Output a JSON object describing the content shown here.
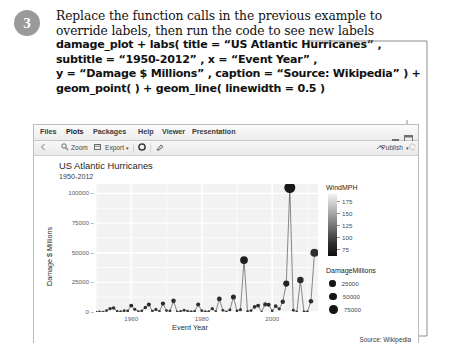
{
  "instruction": {
    "step_number": "3",
    "prose_lines": [
      "Replace the function calls in the previous example to",
      "override labels, then run the code to see new labels"
    ],
    "code_lines": [
      "damage_plot + labs( title = “US Atlantic Hurricanes” ,",
      "subtitle = “1950-2012” , x = “Event Year” ,",
      "y = “Damage $ Millions” , caption = “Source: Wikipedia” ) +",
      "geom_point( ) + geom_line( linewidth = 0.5 )"
    ]
  },
  "rstudio": {
    "tabs": [
      {
        "label": "Files",
        "active": false
      },
      {
        "label": "Plots",
        "active": true
      },
      {
        "label": "Packages",
        "active": false
      },
      {
        "label": "Help",
        "active": false
      },
      {
        "label": "Viewer",
        "active": false
      },
      {
        "label": "Presentation",
        "active": false
      }
    ],
    "window_controls": [
      "minimize-icon",
      "maximize-icon"
    ],
    "toolbar": {
      "back_icon": "back-arrow-icon",
      "zoom_label": "Zoom",
      "zoom_icon": "magnifier-icon",
      "export_label": "Export",
      "export_icon": "export-icon",
      "export_caret": "▾",
      "remove_icon": "remove-plot-icon",
      "clear_icon": "clear-all-plots-icon",
      "publish_label": "Publish",
      "publish_icon": "publish-icon",
      "publish_caret": "▾",
      "refresh_icon": "refresh-icon"
    }
  },
  "chart_data": {
    "type": "line",
    "title": "US Atlantic Hurricanes",
    "subtitle": "1950-2012",
    "xlabel": "Event Year",
    "ylabel": "Damage $ Millions",
    "caption": "Source: Wikipedia",
    "grid": true,
    "panel_background": "#f2f2f2",
    "xlim": [
      1950,
      2013
    ],
    "ylim": [
      0,
      108000
    ],
    "xticks": [
      1960,
      1980,
      2000
    ],
    "yticks": [
      0,
      25000,
      50000,
      75000,
      100000
    ],
    "ytick_labels": [
      "0",
      "25000",
      "50000",
      "75000",
      "100000"
    ],
    "xtick_labels": [
      "1960",
      "1980",
      "2000"
    ],
    "legend": {
      "position": "right",
      "color_legend": {
        "title": "WindMPH",
        "ticks": [
          175,
          150,
          125,
          100,
          75
        ],
        "tick_labels": [
          "175",
          "150",
          "125",
          "100",
          "75"
        ],
        "gradient_low": "#f2f2f2",
        "gradient_high": "#101010"
      },
      "size_legend": {
        "title": "DamageMillions",
        "breaks": [
          25000,
          50000,
          75000
        ],
        "break_labels": [
          "25000",
          "50000",
          "75000"
        ],
        "dot_color": "#151515"
      }
    },
    "series": [
      {
        "name": "Damage",
        "x": [
          1950,
          1951,
          1952,
          1953,
          1954,
          1955,
          1956,
          1957,
          1958,
          1959,
          1960,
          1961,
          1962,
          1963,
          1964,
          1965,
          1966,
          1967,
          1968,
          1969,
          1970,
          1971,
          1972,
          1973,
          1974,
          1975,
          1976,
          1977,
          1978,
          1979,
          1980,
          1981,
          1982,
          1983,
          1984,
          1985,
          1986,
          1987,
          1988,
          1989,
          1990,
          1991,
          1992,
          1993,
          1994,
          1995,
          1996,
          1997,
          1998,
          1999,
          2000,
          2001,
          2002,
          2003,
          2004,
          2005,
          2006,
          2007,
          2008,
          2009,
          2010,
          2011,
          2012
        ],
        "y": [
          200,
          300,
          150,
          1200,
          2900,
          3400,
          700,
          400,
          1100,
          900,
          5400,
          2300,
          400,
          1000,
          3700,
          6300,
          800,
          2200,
          600,
          7100,
          1200,
          900,
          9400,
          300,
          600,
          1500,
          800,
          400,
          700,
          6300,
          1100,
          500,
          400,
          2800,
          400,
          11000,
          1400,
          300,
          1800,
          12700,
          1000,
          2000,
          43800,
          600,
          1200,
          4300,
          5400,
          200,
          6400,
          6200,
          900,
          5000,
          2700,
          8600,
          24000,
          105000,
          1500,
          300,
          27000,
          500,
          400,
          9000,
          50000
        ],
        "wind": [
          80,
          90,
          75,
          100,
          120,
          110,
          85,
          80,
          95,
          90,
          130,
          105,
          80,
          95,
          115,
          125,
          85,
          100,
          80,
          130,
          95,
          85,
          110,
          80,
          85,
          95,
          85,
          80,
          85,
          115,
          90,
          80,
          80,
          100,
          80,
          125,
          95,
          80,
          100,
          130,
          90,
          95,
          165,
          85,
          90,
          110,
          115,
          80,
          105,
          125,
          85,
          110,
          100,
          115,
          140,
          175,
          95,
          80,
          125,
          85,
          80,
          120,
          110
        ]
      }
    ],
    "notable_points": [
      {
        "x": 1992,
        "y": 43800,
        "label": "Andrew"
      },
      {
        "x": 2005,
        "y": 105000,
        "label": "Katrina"
      },
      {
        "x": 2012,
        "y": 50000,
        "label": "Sandy"
      },
      {
        "x": 2004,
        "y": 24000,
        "label": "Ivan"
      },
      {
        "x": 2008,
        "y": 27000,
        "label": "Ike"
      }
    ]
  }
}
